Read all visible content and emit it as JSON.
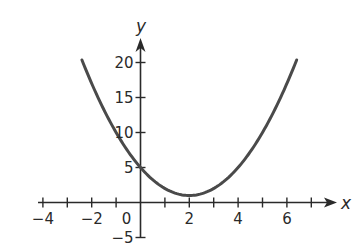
{
  "chart_data": {
    "type": "line",
    "title": "",
    "xlabel": "x",
    "ylabel": "y",
    "function": "y = (x - 2)^2 + 1",
    "xlim": [
      -4.2,
      7.9
    ],
    "ylim": [
      -5.0,
      22.5
    ],
    "x_ticks": [
      -4,
      -3,
      -2,
      -1,
      1,
      2,
      3,
      4,
      5,
      6,
      7
    ],
    "x_tick_labels": [
      {
        "value": -4,
        "label": "−4"
      },
      {
        "value": -2,
        "label": "−2"
      },
      {
        "value": 0,
        "label": "0"
      },
      {
        "value": 2,
        "label": "2"
      },
      {
        "value": 4,
        "label": "4"
      },
      {
        "value": 6,
        "label": "6"
      }
    ],
    "y_ticks": [
      -5,
      5,
      10,
      15,
      20
    ],
    "y_tick_labels": [
      {
        "value": 20,
        "label": "20"
      },
      {
        "value": 15,
        "label": "15"
      },
      {
        "value": 10,
        "label": "10"
      },
      {
        "value": 5,
        "label": "5"
      },
      {
        "value": -5,
        "label": "−5"
      }
    ],
    "series": [
      {
        "name": "parabola",
        "x_range": [
          -2.4,
          6.4
        ],
        "points": [
          {
            "x": -2.4,
            "y": 20.36
          },
          {
            "x": -2,
            "y": 17
          },
          {
            "x": -1,
            "y": 10
          },
          {
            "x": 0,
            "y": 5
          },
          {
            "x": 1,
            "y": 2
          },
          {
            "x": 2,
            "y": 1
          },
          {
            "x": 3,
            "y": 2
          },
          {
            "x": 4,
            "y": 5
          },
          {
            "x": 5,
            "y": 10
          },
          {
            "x": 6,
            "y": 17
          },
          {
            "x": 6.4,
            "y": 20.36
          }
        ]
      }
    ],
    "vertex": {
      "x": 2,
      "y": 1
    },
    "y_intercept": 5,
    "grid": false,
    "legend": null,
    "colors": {
      "curve": "#4a4a4a",
      "axes": "#2a2a2a"
    }
  },
  "layout": {
    "origin_px": [
      140.5,
      202.5
    ],
    "px_per_unit_x": 24.4,
    "px_per_unit_y": 7.0
  }
}
